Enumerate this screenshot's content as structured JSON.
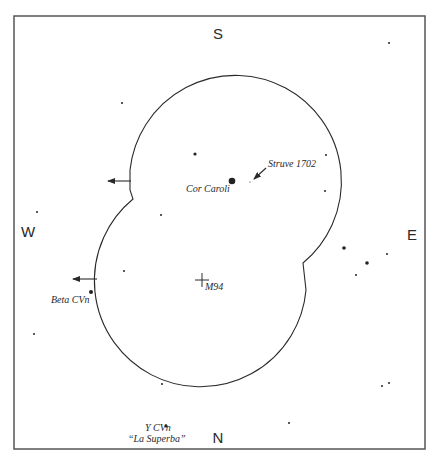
{
  "diagram": {
    "type": "finder-chart",
    "colors": {
      "ink": "#2a2a2a",
      "frame": "#555555",
      "background": "#ffffff"
    },
    "frame": {
      "x": 14,
      "y": 16,
      "width": 411,
      "height": 433
    },
    "cardinals": {
      "top": {
        "text": "S",
        "x": 218,
        "y": 39
      },
      "bottom": {
        "text": "N",
        "x": 218,
        "y": 443
      },
      "left": {
        "text": "W",
        "x": 28,
        "y": 237
      },
      "right": {
        "text": "E",
        "x": 412,
        "y": 240
      }
    },
    "field_outline": {
      "description": "Two overlapping telescope fields (upper and lower circles) with notched junctions",
      "path": "M 130 170 A 106 106 0 1 1 303 263 L 306 290 A 106 106 0 1 1 133 199 L 130 190 Z"
    },
    "arrows": [
      {
        "name": "upper-west-arrow",
        "x1": 131,
        "y1": 181,
        "x2": 108,
        "y2": 181
      },
      {
        "name": "lower-west-arrow",
        "x1": 97,
        "y1": 279,
        "x2": 73,
        "y2": 279
      },
      {
        "name": "struve-pointer-arrow",
        "x1": 266,
        "y1": 168,
        "x2": 254,
        "y2": 179
      }
    ],
    "labels": {
      "cor_caroli": {
        "text": "Cor Caroli",
        "x": 186,
        "y": 192
      },
      "struve": {
        "text": "Struve 1702",
        "x": 268,
        "y": 167
      },
      "m94": {
        "text": "M94",
        "x": 205,
        "y": 290
      },
      "beta_cvn": {
        "text": "Beta CVn",
        "x": 51,
        "y": 303
      },
      "y_cvn": {
        "text": "Y CVn",
        "x": 145,
        "y": 431
      },
      "la_superba": {
        "text": "“La Superba”",
        "x": 128,
        "y": 442
      }
    },
    "m94_marker": {
      "x": 202,
      "y": 280,
      "size": 7
    },
    "stars": [
      {
        "x": 389,
        "y": 43,
        "r": 1.0
      },
      {
        "x": 122,
        "y": 103,
        "r": 1.0
      },
      {
        "x": 195,
        "y": 154,
        "r": 1.6
      },
      {
        "x": 326,
        "y": 155,
        "r": 1.0
      },
      {
        "x": 232,
        "y": 181,
        "r": 3.3,
        "name": "Cor Caroli"
      },
      {
        "x": 250,
        "y": 182,
        "r": 0.6,
        "name": "Struve 1702"
      },
      {
        "x": 325,
        "y": 191,
        "r": 1.0
      },
      {
        "x": 37,
        "y": 212,
        "r": 1.0
      },
      {
        "x": 161,
        "y": 215,
        "r": 1.0
      },
      {
        "x": 344,
        "y": 248,
        "r": 1.8
      },
      {
        "x": 387,
        "y": 254,
        "r": 1.0
      },
      {
        "x": 367,
        "y": 263,
        "r": 1.8
      },
      {
        "x": 356,
        "y": 275,
        "r": 1.0
      },
      {
        "x": 124,
        "y": 271,
        "r": 1.0
      },
      {
        "x": 91,
        "y": 292,
        "r": 2.0,
        "name": "Beta CVn"
      },
      {
        "x": 34,
        "y": 334,
        "r": 1.0
      },
      {
        "x": 162,
        "y": 384,
        "r": 1.0
      },
      {
        "x": 382,
        "y": 386,
        "r": 1.0
      },
      {
        "x": 389,
        "y": 383,
        "r": 1.0
      },
      {
        "x": 289,
        "y": 423,
        "r": 1.0
      },
      {
        "x": 166,
        "y": 426,
        "r": 1.6,
        "name": "Y CVn"
      }
    ]
  }
}
